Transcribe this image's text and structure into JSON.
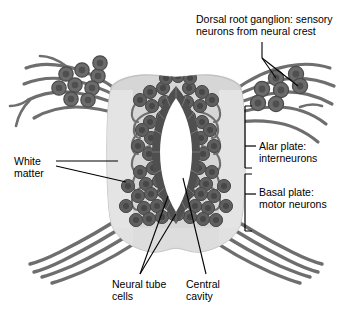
{
  "figure": {
    "type": "anatomical-diagram",
    "background_color": "#ffffff",
    "tube_fill": "#d6d6d6",
    "cell_color": "#5a5a5a",
    "fiber_color": "#6e6e6e",
    "cavity_color": "#ffffff",
    "leader_color": "#000000",
    "text_color": "#000000"
  },
  "labels": {
    "dorsal_root_ganglion": {
      "line1": "Dorsal root ganglion: sensory",
      "line2": "neurons from neural crest"
    },
    "alar_plate": {
      "line1": "Alar plate:",
      "line2": "interneurons"
    },
    "basal_plate": {
      "line1": "Basal plate:",
      "line2": "motor neurons"
    },
    "white_matter": {
      "line1": "White",
      "line2": "matter"
    },
    "neural_tube_cells": {
      "line1": "Neural tube",
      "line2": "cells"
    },
    "central_cavity": {
      "line1": "Central",
      "line2": "cavity"
    }
  }
}
